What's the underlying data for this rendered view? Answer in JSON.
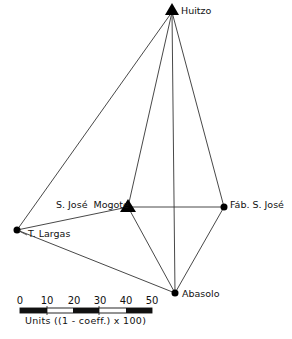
{
  "diagram": {
    "type": "network",
    "line_color": "#333333",
    "node_color": "#000000",
    "nodes": [
      {
        "id": "huitzo",
        "label": "Huitzo",
        "shape": "triangle",
        "x": 172,
        "y": 10
      },
      {
        "id": "sjmogote",
        "label": "S. José  Mogote",
        "shape": "triangle",
        "x": 128,
        "y": 207
      },
      {
        "id": "fabsjose",
        "label": "Fáb. S. José",
        "shape": "circle",
        "x": 224,
        "y": 207
      },
      {
        "id": "tlargas",
        "label": "T. Largas",
        "shape": "circle",
        "x": 17,
        "y": 230
      },
      {
        "id": "abasolo",
        "label": "Abasolo",
        "shape": "circle",
        "x": 175,
        "y": 293
      }
    ],
    "edges": [
      [
        "huitzo",
        "tlargas"
      ],
      [
        "huitzo",
        "sjmogote"
      ],
      [
        "huitzo",
        "abasolo"
      ],
      [
        "huitzo",
        "fabsjose"
      ],
      [
        "tlargas",
        "sjmogote"
      ],
      [
        "tlargas",
        "abasolo"
      ],
      [
        "sjmogote",
        "fabsjose"
      ],
      [
        "sjmogote",
        "abasolo"
      ],
      [
        "fabsjose",
        "abasolo"
      ]
    ]
  },
  "scale_bar": {
    "ticks": [
      "0",
      "10",
      "20",
      "30",
      "40",
      "50"
    ],
    "label": "Units ((1 - coeff.) x 100)"
  }
}
